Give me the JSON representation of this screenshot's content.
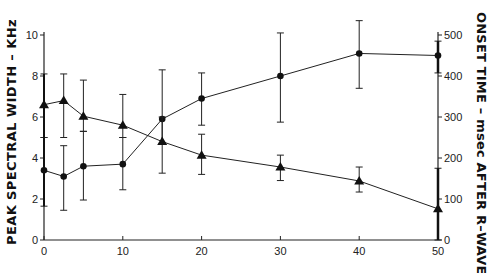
{
  "chart_data": {
    "type": "line",
    "title": "",
    "xlabel": "",
    "ylabel": "PEAK SPECTRAL WIDTH - KHz",
    "ylabel_right": "ONSET TIME - msec AFTER R-WAVE",
    "xlim": [
      0,
      50
    ],
    "ylim": [
      0,
      10
    ],
    "ylim_right": [
      0,
      500
    ],
    "x_ticks": [
      0,
      10,
      20,
      30,
      40,
      50
    ],
    "y_ticks": [
      0,
      2,
      4,
      6,
      8,
      10
    ],
    "y_ticks_right": [
      0,
      100,
      200,
      300,
      400,
      500
    ],
    "grid": false,
    "legend": null,
    "x": [
      0,
      2.5,
      5,
      10,
      15,
      20,
      30,
      40,
      50
    ],
    "series": [
      {
        "name": "Circles (peak spectral width, kHz)",
        "marker": "circle",
        "axis": "left",
        "values": [
          3.4,
          3.1,
          3.6,
          3.7,
          5.9,
          6.9,
          8.0,
          9.1,
          9.0
        ],
        "err_low": [
          1.65,
          1.45,
          1.95,
          2.45,
          4.7,
          5.6,
          5.75,
          7.4,
          8.15
        ],
        "err_high": [
          5.0,
          4.6,
          5.3,
          5.0,
          8.3,
          8.15,
          10.1,
          10.7,
          9.7
        ]
      },
      {
        "name": "Triangles (onset time, msec after R-wave)",
        "marker": "triangle",
        "axis": "right",
        "values": [
          330,
          340,
          302,
          280,
          240,
          207,
          178,
          144,
          76
        ],
        "err_low": [
          250,
          250,
          265,
          250,
          163,
          160,
          145,
          117,
          0
        ],
        "err_high": [
          405,
          405,
          390,
          355,
          300,
          258,
          207,
          178,
          175
        ]
      }
    ]
  },
  "labels": {
    "left": "PEAK  SPECTRAL  WIDTH  –  KHz",
    "right": "ONSET  TIME  –  msec  AFTER  R–WAVE"
  }
}
